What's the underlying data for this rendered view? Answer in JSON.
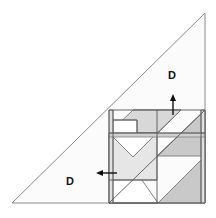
{
  "figure": {
    "background_color": "#ffffff",
    "width": 216,
    "height": 218,
    "stroke_color": "#8a8a8a",
    "stroke_color_dark": "#555555",
    "arrow_color": "#111111",
    "label_color": "#111111"
  },
  "outer_triangle": {
    "name": "large-right-triangle",
    "points": "12,203 205,203 205,13",
    "fill": "#fbfbfb",
    "stroke": "#8a8a8a",
    "stroke_width": 1
  },
  "labels": {
    "upper": {
      "text": "D",
      "x": 172,
      "y": 76
    },
    "lower": {
      "text": "D",
      "x": 70,
      "y": 182
    }
  },
  "arrows": {
    "up": {
      "name": "up-arrow",
      "x": 173,
      "y_tail": 115,
      "y_head": 94,
      "color": "#111111"
    },
    "left": {
      "name": "left-arrow",
      "y": 173,
      "x_tail": 117,
      "x_head": 96,
      "color": "#111111"
    }
  },
  "tangram_square": {
    "name": "tangram-square",
    "x": 109,
    "y": 110,
    "width": 96,
    "height": 93,
    "fill": "#fdfdfd",
    "stroke": "#777777"
  },
  "tangram_pieces": [
    {
      "name": "piece-large-triangle-lower-left",
      "shape": "triangle",
      "points": "109,133 109,203 158,203",
      "fill": "#ffffff",
      "stroke": "#777777"
    },
    {
      "name": "piece-large-triangle-lower-right",
      "shape": "triangle",
      "points": "109,203 158,203 205,156 205,203",
      "fill": "#c9c9c9",
      "stroke": "#777777"
    },
    {
      "name": "piece-medium-triangle-right",
      "shape": "triangle",
      "points": "157,156 205,110 205,156",
      "fill": "#c9c9c9",
      "stroke": "#777777"
    },
    {
      "name": "piece-small-triangle-top",
      "shape": "triangle",
      "points": "133,110 181,110 157,134",
      "fill": "#ffffff",
      "stroke": "#777777"
    },
    {
      "name": "piece-parallelogram-upper",
      "shape": "quad",
      "points": "109,133 133,110 181,110 157,133",
      "fill": "#d8d8d8",
      "stroke": "#777777"
    },
    {
      "name": "piece-square-center",
      "shape": "quad",
      "points": "109,133 157,133 157,180 109,180",
      "fill": "#e6e6e6",
      "stroke": "#777777"
    },
    {
      "name": "piece-triangle-center",
      "shape": "triangle",
      "points": "109,133 157,133 133,157",
      "fill": "#ffffff",
      "stroke": "#777777"
    },
    {
      "name": "piece-small-rect-left",
      "shape": "rect",
      "points": "113,120 137,120 137,133 113,133",
      "fill": "#ffffff",
      "stroke": "#777777"
    },
    {
      "name": "piece-strip-left-vertical",
      "shape": "quad",
      "points": "109,110 113,110 113,203 109,203",
      "fill": "#e0e0e0",
      "stroke": "#8a8a8a"
    },
    {
      "name": "piece-strip-right-edge",
      "shape": "quad",
      "points": "201,110 205,110 205,203 201,203",
      "fill": "#e0e0e0",
      "stroke": "#8a8a8a"
    },
    {
      "name": "piece-band-middle",
      "shape": "quad",
      "points": "109,133 205,133 205,137 109,137",
      "fill": "#cfcfcf",
      "stroke": "#8a8a8a"
    }
  ],
  "guide_lines": [
    {
      "name": "guide-top-edge",
      "x1": 109,
      "y1": 110,
      "x2": 205,
      "y2": 110
    },
    {
      "name": "guide-square-left",
      "x1": 109,
      "y1": 110,
      "x2": 109,
      "y2": 203
    },
    {
      "name": "guide-square-right",
      "x1": 205,
      "y1": 110,
      "x2": 205,
      "y2": 203
    },
    {
      "name": "guide-square-bottom",
      "x1": 109,
      "y1": 203,
      "x2": 205,
      "y2": 203
    },
    {
      "name": "guide-mid-horizontal",
      "x1": 109,
      "y1": 133,
      "x2": 205,
      "y2": 133
    },
    {
      "name": "guide-center-vertical",
      "x1": 157,
      "y1": 110,
      "x2": 157,
      "y2": 203
    },
    {
      "name": "guide-diagonal-main",
      "x1": 109,
      "y1": 203,
      "x2": 205,
      "y2": 110
    },
    {
      "name": "guide-strip-inner-left",
      "x1": 113,
      "y1": 110,
      "x2": 113,
      "y2": 203
    },
    {
      "name": "guide-strip-inner-right",
      "x1": 201,
      "y1": 110,
      "x2": 201,
      "y2": 203
    },
    {
      "name": "guide-small-rect-top",
      "x1": 113,
      "y1": 120,
      "x2": 137,
      "y2": 120
    },
    {
      "name": "guide-small-rect-right",
      "x1": 137,
      "y1": 120,
      "x2": 137,
      "y2": 133
    },
    {
      "name": "guide-square-center-bottom",
      "x1": 109,
      "y1": 180,
      "x2": 157,
      "y2": 180
    }
  ]
}
